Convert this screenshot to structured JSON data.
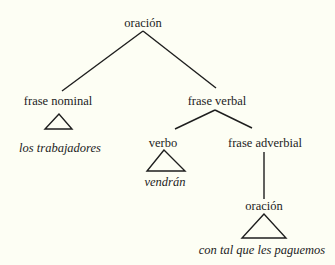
{
  "diagram": {
    "type": "syntax-tree",
    "nodes": {
      "root": {
        "label": "oración"
      },
      "np": {
        "label": "frase nominal",
        "leaf": "los trabajadores"
      },
      "vp": {
        "label": "frase verbal"
      },
      "verb": {
        "label": "verbo",
        "leaf": "vendrán"
      },
      "advp": {
        "label": "frase adverbial"
      },
      "sub_s": {
        "label": "oración",
        "leaf": "con tal que les paguemos"
      }
    },
    "edges": [
      [
        "oración",
        "frase nominal"
      ],
      [
        "oración",
        "frase verbal"
      ],
      [
        "frase verbal",
        "verbo"
      ],
      [
        "frase verbal",
        "frase adverbial"
      ],
      [
        "frase adverbial",
        "oración"
      ]
    ],
    "colors": {
      "background": "#fdfef4",
      "ink": "#1e1e1e"
    }
  }
}
